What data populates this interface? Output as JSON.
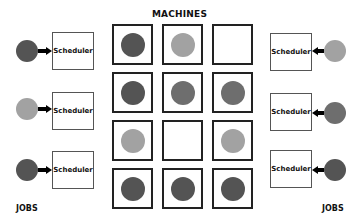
{
  "title": "MACHINES",
  "labels": {
    "left_jobs": "JOBS",
    "right_jobs": "JOBS"
  },
  "colors": {
    "dark": "#545454",
    "medium": "#6e6e6e",
    "light": "#a2a2a2"
  },
  "left_schedulers": [
    {
      "label": "Scheduler",
      "job_tone": "dark"
    },
    {
      "label": "Scheduler",
      "job_tone": "light"
    },
    {
      "label": "Scheduler",
      "job_tone": "dark"
    }
  ],
  "right_schedulers": [
    {
      "label": "Scheduler",
      "job_tone": "light"
    },
    {
      "label": "Scheduler",
      "job_tone": "medium"
    },
    {
      "label": "Scheduler",
      "job_tone": "dark"
    }
  ],
  "machines_grid": [
    [
      "dark",
      "light",
      "empty"
    ],
    [
      "dark",
      "medium",
      "medium"
    ],
    [
      "light",
      "empty",
      "light"
    ],
    [
      "dark",
      "dark",
      "dark"
    ]
  ]
}
